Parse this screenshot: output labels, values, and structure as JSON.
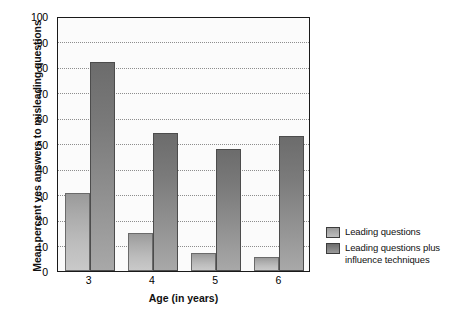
{
  "chart_data": {
    "type": "bar",
    "title": "",
    "xlabel": "Age (in years)",
    "ylabel": "Mean percent yes answers to misleading questions",
    "categories": [
      "3",
      "4",
      "5",
      "6"
    ],
    "ylim": [
      0,
      100
    ],
    "yticks": [
      0,
      10,
      20,
      30,
      40,
      50,
      60,
      70,
      80,
      90,
      100
    ],
    "ytick_labels": [
      "0",
      "10",
      "20",
      "30",
      "40",
      "50",
      "60",
      "70",
      "80",
      "90",
      "100"
    ],
    "grid": true,
    "grid_style": "dotted-horizontal",
    "legend_position": "right",
    "series": [
      {
        "name": "Leading questions",
        "color": "#b4b4b4",
        "values": [
          30.5,
          15,
          7,
          5.5
        ]
      },
      {
        "name": "Leading questions plus influence techniques",
        "color": "#7e7e7e",
        "values": [
          82,
          54,
          48,
          53
        ]
      }
    ]
  },
  "legend": {
    "items": [
      {
        "label": "Leading questions"
      },
      {
        "label": "Leading questions plus influence techniques"
      }
    ]
  },
  "colors": {
    "series_light": "#b4b4b4",
    "series_dark": "#7e7e7e",
    "axis": "#1a1a1a",
    "grid": "#8d8d8d",
    "background": "#ffffff"
  }
}
